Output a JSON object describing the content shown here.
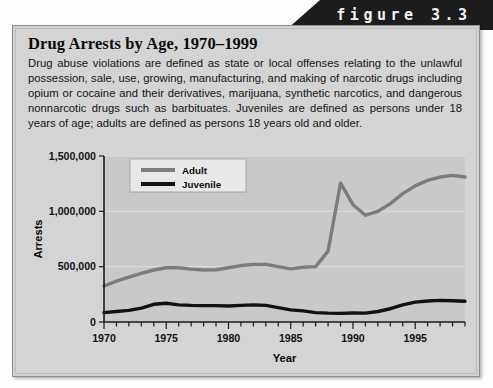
{
  "figure": {
    "tab_label": "figure 3.3",
    "title": "Drug Arrests by Age, 1970–1999",
    "body_text": "Drug abuse violations are defined as state or local offenses relating to the unlawful possession, sale, use, growing, manufacturing, and making of narcotic drugs including opium or cocaine and their derivatives, marijuana, synthetic narcotics, and dangerous nonnarcotic drugs such as barbituates. Juveniles are defined as persons under 18 years of age; adults are defined as persons 18 years old and older."
  },
  "colors": {
    "tab_background": "#1c1c1c",
    "tab_text": "#f2f2f2",
    "panel_background": "#d4d4d4",
    "plot_background": "#c9c9c9",
    "adult_line": "#7c7c7c",
    "juvenile_line": "#121212",
    "gridline": "#dedede",
    "axis": "#1a1a1a"
  },
  "chart_data": {
    "type": "line",
    "title": "",
    "xlabel": "Year",
    "ylabel": "Arrests",
    "xlim": [
      1970,
      1999
    ],
    "ylim": [
      0,
      1500000
    ],
    "yticks": [
      0,
      500000,
      1000000,
      1500000
    ],
    "ytick_labels": [
      "0",
      "500,000",
      "1,000,000",
      "1,500,000"
    ],
    "xticks": [
      1970,
      1975,
      1980,
      1985,
      1990,
      1995
    ],
    "xtick_labels": [
      "1970",
      "1975",
      "1980",
      "1985",
      "1990",
      "1995"
    ],
    "minor_xticks_every": 1,
    "grid": true,
    "legend_position": "top-left-inside",
    "x": [
      1970,
      1971,
      1972,
      1973,
      1974,
      1975,
      1976,
      1977,
      1978,
      1979,
      1980,
      1981,
      1982,
      1983,
      1984,
      1985,
      1986,
      1987,
      1988,
      1989,
      1990,
      1991,
      1992,
      1993,
      1994,
      1995,
      1996,
      1997,
      1998,
      1999
    ],
    "series": [
      {
        "name": "Adult",
        "color": "#7c7c7c",
        "values": [
          325000,
          370000,
          405000,
          440000,
          470000,
          490000,
          490000,
          478000,
          470000,
          472000,
          490000,
          510000,
          520000,
          520000,
          500000,
          480000,
          495000,
          500000,
          640000,
          1255000,
          1060000,
          965000,
          1000000,
          1070000,
          1160000,
          1230000,
          1280000,
          1310000,
          1325000,
          1310000
        ]
      },
      {
        "name": "Juvenile",
        "color": "#121212",
        "values": [
          85000,
          95000,
          105000,
          125000,
          160000,
          170000,
          155000,
          150000,
          148000,
          148000,
          145000,
          150000,
          155000,
          150000,
          130000,
          110000,
          100000,
          85000,
          80000,
          78000,
          82000,
          80000,
          95000,
          120000,
          155000,
          180000,
          190000,
          195000,
          192000,
          188000
        ]
      }
    ]
  }
}
